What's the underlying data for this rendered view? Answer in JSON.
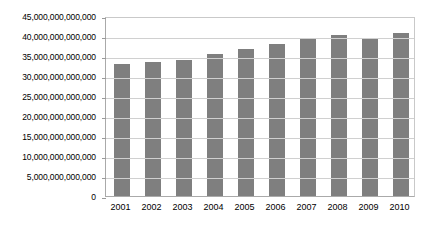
{
  "chart_data": {
    "type": "bar",
    "title": "",
    "subtitle": "",
    "xlabel": "",
    "ylabel": "",
    "categories": [
      "2001",
      "2002",
      "2003",
      "2004",
      "2005",
      "2006",
      "2007",
      "2008",
      "2009",
      "2010"
    ],
    "values": [
      33100000000000,
      33600000000000,
      34100000000000,
      35400000000000,
      36700000000000,
      37900000000000,
      39400000000000,
      40200000000000,
      39200000000000,
      40700000000000
    ],
    "series": [
      {
        "name": "Series 1",
        "values": [
          33100000000000,
          33600000000000,
          34100000000000,
          35400000000000,
          36700000000000,
          37900000000000,
          39400000000000,
          40200000000000,
          39200000000000,
          40700000000000
        ]
      }
    ],
    "ylim": [
      0,
      45000000000000
    ],
    "ytick_values": [
      0,
      5000000000000,
      10000000000000,
      15000000000000,
      20000000000000,
      25000000000000,
      30000000000000,
      35000000000000,
      40000000000000,
      45000000000000
    ],
    "ytick_labels": [
      "0",
      "5,000,000,000,000",
      "10,000,000,000,000",
      "15,000,000,000,000",
      "20,000,000,000,000",
      "25,000,000,000,000",
      "30,000,000,000,000",
      "35,000,000,000,000",
      "40,000,000,000,000",
      "45,000,000,000,000"
    ],
    "grid": true,
    "grid_axis": "y",
    "legend": false,
    "legend_position": "none",
    "bar_color": "#7f7f7f",
    "gridline_color": "#d0d0d0",
    "axis_color": "#aaaaaa",
    "background_color": "#ffffff"
  }
}
